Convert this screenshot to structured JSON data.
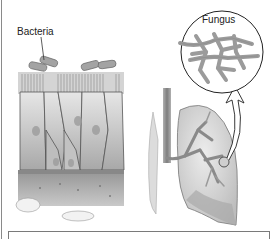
{
  "figure": {
    "labels": {
      "bacteria": "Bacteria",
      "fungus": "Fungus"
    },
    "panels": [
      {
        "name": "epithelium-panel",
        "description": "Ciliated epithelial cells with rod-shaped bacteria on surface"
      },
      {
        "name": "lung-panel",
        "description": "Lung with trachea and bronchial tree; arrow points to magnified fungus"
      }
    ],
    "colors": {
      "tissue_light": "#d9d9d9",
      "tissue_mid": "#b5b5b5",
      "tissue_dark": "#8c8c8c",
      "bacteria": "#9a9a9a",
      "outline": "#333333",
      "border": "#7a7a7a"
    },
    "caption": ""
  }
}
